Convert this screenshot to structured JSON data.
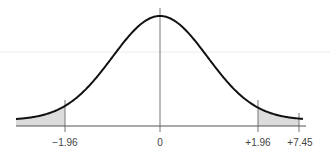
{
  "chart_data": {
    "type": "line",
    "title": "",
    "subtitle": "Standard normal distribution with two-tailed critical regions shaded",
    "xlabel": "",
    "ylabel": "",
    "xlim": [
      -3.2,
      7.45
    ],
    "grid": false,
    "legend": null,
    "curve": "standard normal density",
    "tick_labels": [
      "−1.96",
      "0",
      "+1.96",
      "+7.45"
    ],
    "tick_values": [
      -1.96,
      0,
      1.96,
      7.45
    ],
    "shaded_regions": [
      {
        "from": -3.2,
        "to": -1.96,
        "label": "lower rejection region"
      },
      {
        "from": 1.96,
        "to": 7.45,
        "label": "upper rejection region"
      }
    ],
    "vertical_lines": [
      -1.96,
      0,
      1.96,
      7.45
    ],
    "colors": {
      "curve": "#111111",
      "shade": "#dcdcdc",
      "axis": "#555555",
      "guide": "#e6e6e6"
    }
  },
  "labels": {
    "neg_crit": "−1.96",
    "zero": "0",
    "pos_crit": "+1.96",
    "observed": "+7.45"
  }
}
